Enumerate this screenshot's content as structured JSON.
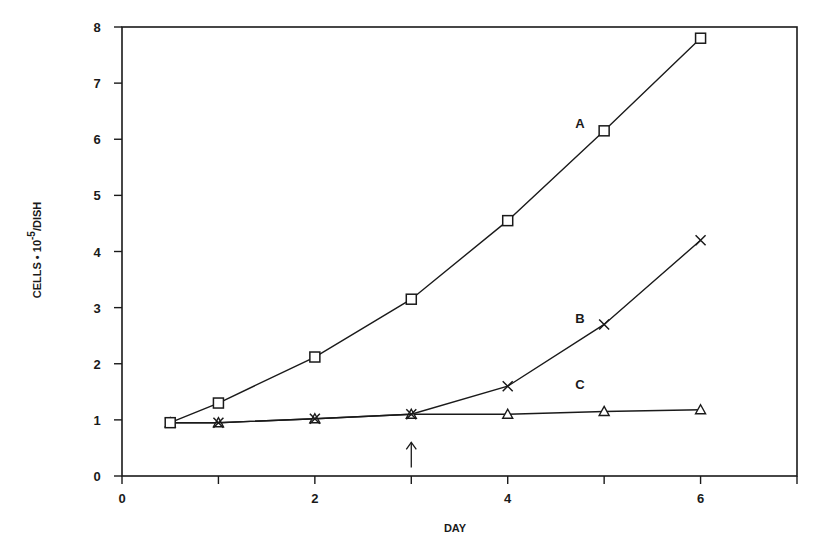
{
  "chart_data": {
    "type": "line",
    "title": "",
    "xlabel": "DAY",
    "ylabel": "CELLS • 10⁻⁵/DISH",
    "ylabel_parts": {
      "main": "CELLS • 10",
      "exp": "-5",
      "suffix": "/DISH"
    },
    "xlim": [
      0,
      7
    ],
    "ylim": [
      0,
      8
    ],
    "x_ticks": [
      0,
      1,
      2,
      3,
      4,
      5,
      6,
      7
    ],
    "x_tick_labels": [
      "0",
      "",
      "2",
      "",
      "4",
      "",
      "6",
      ""
    ],
    "y_ticks": [
      0,
      1,
      2,
      3,
      4,
      5,
      6,
      7,
      8
    ],
    "y_tick_labels": [
      "0",
      "1",
      "2",
      "3",
      "4",
      "5",
      "6",
      "7",
      "8"
    ],
    "grid": false,
    "legend": "inline labels",
    "series": [
      {
        "name": "A",
        "marker": "square",
        "x": [
          0.5,
          1,
          2,
          3,
          4,
          5,
          6
        ],
        "values": [
          0.95,
          1.3,
          2.12,
          3.15,
          4.55,
          6.15,
          7.8
        ],
        "label_pos": [
          4.75,
          6.2
        ]
      },
      {
        "name": "B",
        "marker": "x",
        "x": [
          0.5,
          1,
          2,
          3,
          4,
          5,
          6
        ],
        "values": [
          0.95,
          0.95,
          1.02,
          1.1,
          1.6,
          2.7,
          4.2
        ],
        "label_pos": [
          4.75,
          2.72
        ]
      },
      {
        "name": "C",
        "marker": "triangle",
        "x": [
          0.5,
          1,
          2,
          3,
          4,
          5,
          6
        ],
        "values": [
          0.95,
          0.95,
          1.02,
          1.1,
          1.1,
          1.15,
          1.18
        ],
        "label_pos": [
          4.75,
          1.55
        ]
      }
    ],
    "annotations": [
      {
        "type": "arrow-up",
        "x": 3,
        "y_from": 0.15,
        "y_to": 0.6,
        "text": "↑"
      }
    ]
  }
}
